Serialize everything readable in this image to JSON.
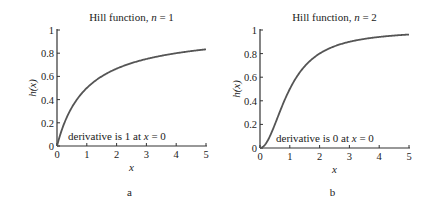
{
  "chart_data": [
    {
      "type": "line",
      "panel_label": "a",
      "title": "Hill function, n = 1",
      "title_prefix": "Hill function, ",
      "title_var": "n",
      "title_suffix": " = 1",
      "xlabel": "x",
      "ylabel": "h(x)",
      "xlim": [
        0,
        5
      ],
      "ylim": [
        0,
        1
      ],
      "xticks": [
        "0",
        "1",
        "2",
        "3",
        "4",
        "5"
      ],
      "yticks": [
        "0",
        "0.2",
        "0.4",
        "0.6",
        "0.8",
        "1"
      ],
      "annotation": "derivative is 1 at x = 0",
      "annotation_prefix": "derivative is 1 at ",
      "annotation_var": "x",
      "annotation_suffix": " = 0",
      "formula": "h(x) = x/(1+x)",
      "hill_n": 1,
      "x": [
        0,
        0.5,
        1,
        1.5,
        2,
        2.5,
        3,
        3.5,
        4,
        4.5,
        5
      ],
      "values": [
        0,
        0.333,
        0.5,
        0.6,
        0.667,
        0.714,
        0.75,
        0.778,
        0.8,
        0.818,
        0.833
      ],
      "grid": false
    },
    {
      "type": "line",
      "panel_label": "b",
      "title": "Hill function, n = 2",
      "title_prefix": "Hill function, ",
      "title_var": "n",
      "title_suffix": " = 2",
      "xlabel": "x",
      "ylabel": "h(x)",
      "xlim": [
        0,
        5
      ],
      "ylim": [
        0,
        1
      ],
      "xticks": [
        "0",
        "1",
        "2",
        "3",
        "4",
        "5"
      ],
      "yticks": [
        "0",
        "0.2",
        "0.4",
        "0.6",
        "0.8",
        "1"
      ],
      "annotation": "derivative is 0 at x = 0",
      "annotation_prefix": "derivative is 0 at ",
      "annotation_var": "x",
      "annotation_suffix": " = 0",
      "formula": "h(x) = x^2/(1+x^2)",
      "hill_n": 2,
      "x": [
        0,
        0.5,
        1,
        1.5,
        2,
        2.5,
        3,
        3.5,
        4,
        4.5,
        5
      ],
      "values": [
        0,
        0.2,
        0.5,
        0.692,
        0.8,
        0.862,
        0.9,
        0.925,
        0.941,
        0.953,
        0.962
      ],
      "grid": false
    }
  ],
  "colors": {
    "curve": "#555555",
    "axis": "#333333",
    "text": "#222222"
  }
}
